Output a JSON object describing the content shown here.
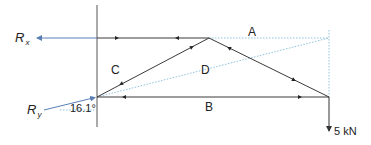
{
  "diagram": {
    "type": "truss-free-body-diagram",
    "labels": {
      "reaction_x": {
        "main": "R",
        "sub": "x"
      },
      "reaction_y": {
        "main": "R",
        "sub": "y"
      },
      "region_a": "A",
      "region_b": "B",
      "region_c": "C",
      "region_d": "D",
      "angle": "16.1°",
      "load": "5 kN"
    },
    "colors": {
      "member": "#3a3a3a",
      "reaction": "#5a7fb5",
      "construction": "#8fc3dc",
      "text": "#222222"
    },
    "nodes": {
      "left_support": [
        97,
        97
      ],
      "apex": [
        209,
        38
      ],
      "right_load": [
        329,
        97
      ],
      "top_left": [
        97,
        38
      ]
    }
  }
}
